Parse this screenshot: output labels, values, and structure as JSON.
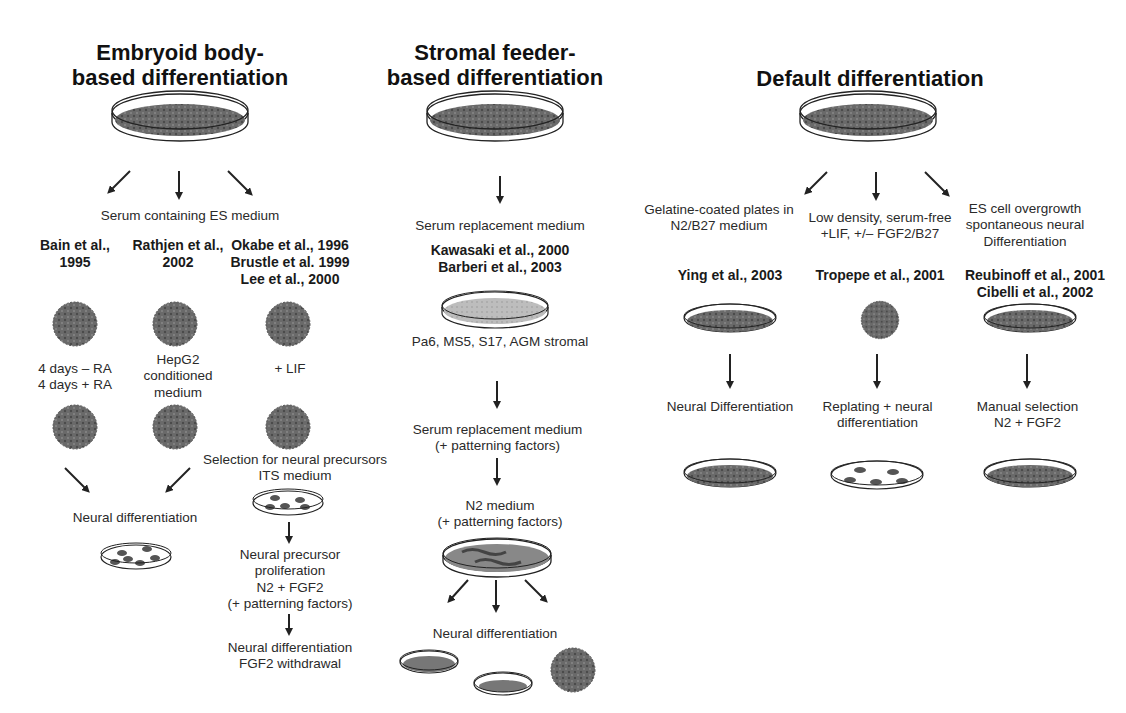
{
  "figure": {
    "columns": [
      {
        "id": "embryoid",
        "title": "Embryoid body-\nbased differentiation",
        "medium": "Serum containing ES medium",
        "branches": [
          {
            "citation": "Bain et al.,\n1995",
            "condition": "4 days – RA\n4 days + RA"
          },
          {
            "citation": "Rathjen et al.,\n2002",
            "condition": "HepG2\nconditioned\nmedium"
          },
          {
            "citation": "Okabe et al., 1996\nBrustle et al. 1999\nLee et al., 2000",
            "condition": "+ LIF"
          }
        ],
        "merge_result": "Neural differentiation",
        "selection_step": "Selection for neural precursors\nITS medium",
        "proliferation_step": "Neural precursor\nproliferation\nN2 + FGF2\n(+ patterning factors)",
        "final_step": "Neural differentiation\nFGF2 withdrawal"
      },
      {
        "id": "stromal",
        "title": "Stromal feeder-\nbased differentiation",
        "medium": "Serum replacement medium",
        "citation": "Kawasaki et al., 2000\nBarberi et al., 2003",
        "feeder": "Pa6, MS5, S17, AGM stromal",
        "step2": "Serum replacement medium\n(+ patterning factors)",
        "step3": "N2 medium\n(+ patterning factors)",
        "result": "Neural differentiation"
      },
      {
        "id": "default",
        "title": "Default differentiation",
        "branches": [
          {
            "condition": "Gelatine-coated plates in\nN2/B27 medium",
            "citation": "Ying et al., 2003",
            "next": "Neural Differentiation"
          },
          {
            "condition": "Low density, serum-free\n+LIF, +/– FGF2/B27",
            "citation": "Tropepe et al., 2001",
            "next": "Replating + neural\ndifferentiation"
          },
          {
            "condition": "ES cell overgrowth\nspontaneous neural\nDifferentiation",
            "citation": "Reubinoff et al., 2001\nCibelli et al., 2002",
            "next": "Manual selection\nN2 + FGF2"
          }
        ]
      }
    ],
    "colors": {
      "ink": "#1a1a1a",
      "cell_fill": "#5a5a5a",
      "stromal_fill": "#b8b8b8",
      "background": "#ffffff"
    }
  }
}
